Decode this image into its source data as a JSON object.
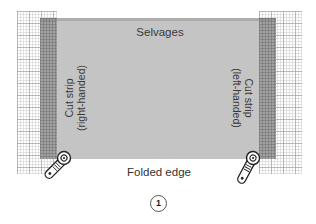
{
  "diagram": {
    "type": "cutting-layout",
    "labels": {
      "top_edge": "Selvages",
      "bottom_edge": "Folded edge",
      "left_strip": {
        "line1": "Cut strip",
        "line2": "(right-handed)"
      },
      "right_strip": {
        "line1": "Cut strip",
        "line2": "(left-handed)"
      }
    },
    "step_number": "1",
    "elements": {
      "fabric": {
        "color": "#c4c4c4"
      },
      "cutting_mats": [
        "left",
        "right"
      ],
      "rotary_cutters": [
        {
          "position": "bottom-left",
          "icon": "rotary-cutter-icon"
        },
        {
          "position": "bottom-right",
          "icon": "rotary-cutter-icon"
        }
      ]
    }
  }
}
